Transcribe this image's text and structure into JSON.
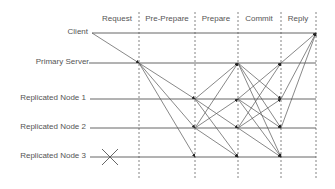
{
  "diagram": {
    "phases": [
      {
        "label": "Request",
        "center_x": 117
      },
      {
        "label": "Pre-Prepare",
        "center_x": 167
      },
      {
        "label": "Prepare",
        "center_x": 216
      },
      {
        "label": "Commit",
        "center_x": 259
      },
      {
        "label": "Reply",
        "center_x": 298
      }
    ],
    "nodes": [
      {
        "label": "Client",
        "y": 33,
        "right_x": 88,
        "line_start_x": 92
      },
      {
        "label": "Primary Server",
        "y": 63,
        "right_x": 89,
        "line_start_x": 89
      },
      {
        "label": "Replicated Node 1",
        "y": 99,
        "right_x": 86,
        "line_start_x": 90
      },
      {
        "label": "Replicated Node 2",
        "y": 128,
        "right_x": 86,
        "line_start_x": 90
      },
      {
        "label": "Replicated Node 3",
        "y": 157,
        "right_x": 86,
        "line_start_x": 90
      }
    ],
    "phase_boundaries_x": [
      139,
      195,
      238,
      281,
      316
    ],
    "failed_node": {
      "label": "Replicated Node 3",
      "marker": "X",
      "x": 110,
      "y": 157
    },
    "colors": {
      "line": "#555555",
      "arrow": "#222222",
      "dashed": "#666666",
      "text": "#555555"
    }
  }
}
